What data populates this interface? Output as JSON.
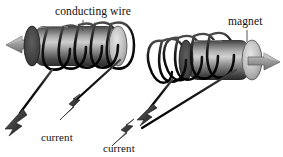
{
  "figure": {
    "background_color": "#ffffff",
    "labels": {
      "conducting_wire": "conducting wire",
      "magnet": "magnet",
      "current_left": "current",
      "current_right": "current"
    },
    "colors": {
      "wire": "#1b1b1b",
      "magnet_light": "#d8d8d8",
      "magnet_mid": "#8d8d8d",
      "magnet_dark": "#2a2a2a",
      "arrow_field": "#9a9a9a",
      "arrow_current": "#3a3a3a",
      "label_text": "#111111",
      "leader_line": "#555555"
    },
    "assemblies": [
      {
        "name": "left-solenoid",
        "magnet_label": "",
        "field_arrow_direction": "left",
        "coil_turns": 5,
        "coil_side": "right",
        "current_arrow_direction": "up-right",
        "lead_arrow_direction": "down-left"
      },
      {
        "name": "right-solenoid",
        "magnet_label": "magnet",
        "field_arrow_direction": "right",
        "coil_turns": 5,
        "coil_side": "left",
        "current_arrow_direction": "up-right",
        "lead_arrow_direction": "down-left"
      }
    ]
  }
}
